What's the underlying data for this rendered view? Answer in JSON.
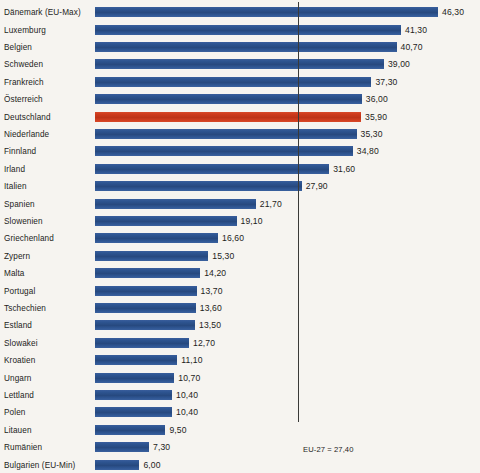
{
  "chart_data": {
    "type": "bar",
    "orientation": "horizontal",
    "title": "",
    "subtitle": "",
    "xlabel": "",
    "ylabel": "",
    "xlim": [
      0,
      46.3
    ],
    "grid": false,
    "legend": null,
    "value_format": "comma-decimal",
    "categories": [
      "Dänemark (EU-Max)",
      "Luxemburg",
      "Belgien",
      "Schweden",
      "Frankreich",
      "Österreich",
      "Deutschland",
      "Niederlande",
      "Finnland",
      "Irland",
      "Italien",
      "Spanien",
      "Slowenien",
      "Griechenland",
      "Zypern",
      "Malta",
      "Portugal",
      "Tschechien",
      "Estland",
      "Slowakei",
      "Kroatien",
      "Ungarn",
      "Lettland",
      "Polen",
      "Litauen",
      "Rumänien",
      "Bulgarien (EU-Min)"
    ],
    "values": [
      46.3,
      41.3,
      40.7,
      39.0,
      37.3,
      36.0,
      35.9,
      35.3,
      34.8,
      31.6,
      27.9,
      21.7,
      19.1,
      16.6,
      15.3,
      14.2,
      13.7,
      13.6,
      13.5,
      12.7,
      11.1,
      10.7,
      10.4,
      10.4,
      9.5,
      7.3,
      6.0
    ],
    "value_labels": [
      "46,30",
      "41,30",
      "40,70",
      "39,00",
      "37,30",
      "36,00",
      "35,90",
      "35,30",
      "34,80",
      "31,60",
      "27,90",
      "21,70",
      "19,10",
      "16,60",
      "15,30",
      "14,20",
      "13,70",
      "13,60",
      "13,50",
      "12,70",
      "11,10",
      "10,70",
      "10,40",
      "10,40",
      "9,50",
      "7,30",
      "6,00"
    ],
    "highlight_index": 6,
    "reference_line": {
      "label": "EU-27 = 27,40",
      "value": 27.4
    },
    "colors": {
      "bar": "#2d5490",
      "highlight_bar": "#ce3a1c",
      "background": "#f6f4f0",
      "text": "#1d1d1b",
      "reference_line": "#3a3a38"
    }
  }
}
